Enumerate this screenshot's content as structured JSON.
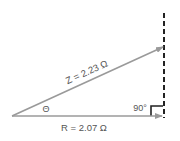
{
  "diagram": {
    "type": "impedance-triangle",
    "vectors": {
      "resistance": {
        "label": "R = 2.07 Ω",
        "symbol": "R",
        "value": 2.07,
        "unit": "Ω"
      },
      "impedance": {
        "label": "Z = 2.23 Ω",
        "symbol": "Z",
        "value": 2.23,
        "unit": "Ω"
      }
    },
    "angle_label": "Θ",
    "right_angle_label": "90°",
    "colors": {
      "vector": "#9a9a9a",
      "dashed_line": "#222222",
      "right_angle_marker": "#222222",
      "text": "#555555"
    }
  }
}
